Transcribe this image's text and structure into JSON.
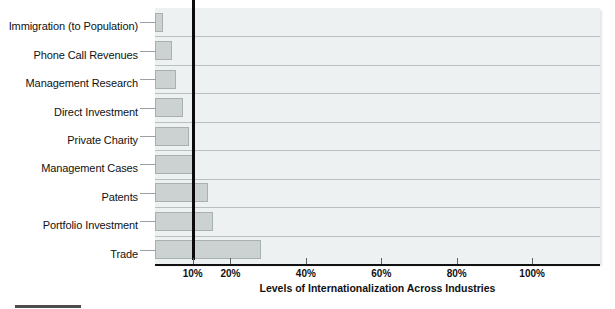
{
  "chart_data": {
    "type": "bar",
    "orientation": "horizontal",
    "title": "",
    "xlabel": "Levels of Internationalization Across Industries",
    "ylabel": "",
    "categories": [
      "Immigration (to Population)",
      "Phone Call Revenues",
      "Management Research",
      "Direct Investment",
      "Private Charity",
      "Management Cases",
      "Patents",
      "Portfolio Investment",
      "Trade"
    ],
    "values": [
      2,
      4.5,
      5.5,
      7.5,
      9,
      10.5,
      14,
      15.5,
      28
    ],
    "value_unit": "%",
    "xlim": [
      0,
      118
    ],
    "xticks": [
      10,
      20,
      40,
      60,
      80,
      100
    ],
    "xtick_labels": [
      "10%",
      "20%",
      "40%",
      "60%",
      "80%",
      "100%"
    ],
    "grid": "horizontal",
    "legend": "none",
    "reference_line": {
      "value": 10,
      "label": "10%",
      "style": "thick-black-vertical"
    },
    "colors": {
      "bar_fill": "#ccd1d1",
      "bar_border": "#a9b0b1",
      "plot_background": "#eef1f1",
      "gridline": "#b9c0c2",
      "axis": "#111111",
      "reference_line": "#0b0b0b",
      "text": "#111111"
    }
  }
}
